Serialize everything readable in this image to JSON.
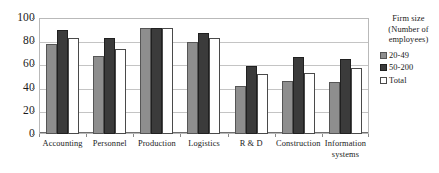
{
  "chart_data": {
    "type": "bar",
    "title": "",
    "xlabel": "",
    "ylabel": "",
    "ylim": [
      0,
      100
    ],
    "yticks": [
      0,
      20,
      40,
      60,
      80,
      100
    ],
    "grid": true,
    "legend_position": "right",
    "legend_title": "Firm size (Number of employees)",
    "categories": [
      "Accounting",
      "Personnel",
      "Production",
      "Logistics",
      "R & D",
      "Construction",
      "Information\nsystems"
    ],
    "series": [
      {
        "name": "20-49",
        "color": "#8e8e8e",
        "values": [
          78,
          67,
          91,
          79,
          41,
          46,
          45
        ]
      },
      {
        "name": "50-200",
        "color": "#3b3b3b",
        "values": [
          90,
          83,
          91,
          87,
          59,
          66,
          65
        ]
      },
      {
        "name": "Total",
        "color": "#ffffff",
        "values": [
          83,
          73,
          91,
          83,
          52,
          53,
          57
        ]
      }
    ]
  },
  "axis": {
    "y_tick_labels": [
      "100",
      "80",
      "60",
      "40",
      "20",
      "0"
    ]
  },
  "legend": {
    "title_lines": [
      "Firm size",
      "(Number of",
      "employees)"
    ],
    "entries": [
      {
        "label": "20-49"
      },
      {
        "label": "50-200"
      },
      {
        "label": "Total"
      }
    ]
  }
}
